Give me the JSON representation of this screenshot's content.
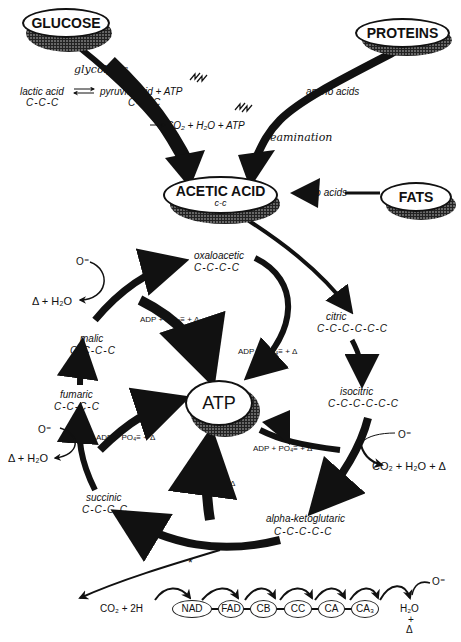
{
  "sources": {
    "glucose": "GLUCOSE",
    "proteins": "PROTEINS",
    "fats": "FATS"
  },
  "glycolysis": {
    "process_label": "glycolysis",
    "lactic_acid": "lactic acid",
    "lactic_chain": "C-C-C",
    "pyruvic_acid": "pyruvic acid + ATP",
    "pyruvic_chain": "C-C-C",
    "oxidation": "CO₂ + H₂O + ATP"
  },
  "protein_path": {
    "amino_acids": "amino acids",
    "process_label": "deamination"
  },
  "acetic_acid": {
    "name": "ACETIC ACID",
    "chain": "c-c"
  },
  "fat_path": {
    "keto_acids": "keto acids"
  },
  "cycle": {
    "oxaloacetic": {
      "name": "oxaloacetic",
      "chain": "C-C-C-C"
    },
    "citric": {
      "name": "citric",
      "chain": "C-C-C-C-C-C"
    },
    "isocitric": {
      "name": "isocitric",
      "chain": "C-C-C-C-C-C"
    },
    "alpha_ketoglutaric": {
      "name": "alpha-ketoglutaric",
      "chain": "C-C-C-C-C"
    },
    "succinic": {
      "name": "succinic",
      "chain": "C-C-C-C"
    },
    "fumaric": {
      "name": "fumaric",
      "chain": "C-C-C-C"
    },
    "malic": {
      "name": "malic",
      "chain": "C-C-C-C"
    }
  },
  "atp_center": {
    "label": "ATP"
  },
  "reactions": {
    "adp_label": "ADP + PO₄≡ + Δ",
    "oxygen": "O⁼",
    "heat_water": "Δ + H₂O",
    "co2_water_heat": "CO₂ + H₂O + Δ"
  },
  "electron_transport": {
    "input": "CO₂ + 2H",
    "asterisk": "*",
    "carriers": [
      "NAD",
      "FAD",
      "CB",
      "CC",
      "CA",
      "CA₃"
    ],
    "output_water": "H₂O",
    "output_plus": "+",
    "output_heat": "Δ",
    "oxygen": "O⁼"
  }
}
